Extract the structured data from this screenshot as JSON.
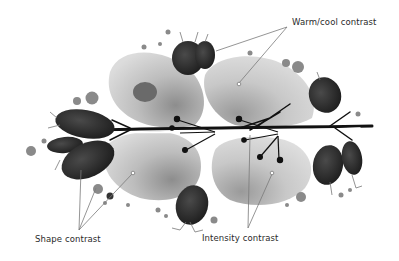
{
  "figure": {
    "annotations": [
      {
        "id": "warm",
        "text": "Warm/cool contrast"
      },
      {
        "id": "shape",
        "text": "Shape contrast"
      },
      {
        "id": "intensity",
        "text": "Intensity contrast"
      }
    ],
    "colors": {
      "background": "#ffffff",
      "pale_petal": "#d4d4d4",
      "mid_petal": "#a8a8a8",
      "dark_leaf": "#2b2b2b",
      "black_stem": "#111111",
      "dot_gray": "#8a8a8a",
      "line": "#7a7a7a",
      "text": "#2a2a2a"
    }
  }
}
